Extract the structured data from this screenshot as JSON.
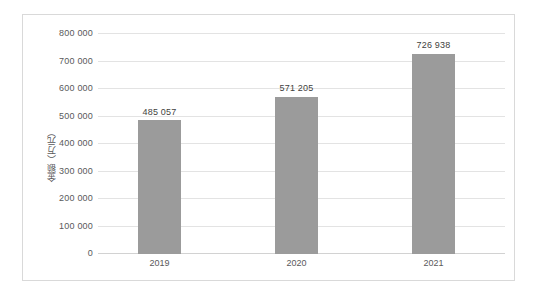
{
  "chart_data": {
    "type": "bar",
    "title": "",
    "subtitle": "",
    "xlabel": "",
    "ylabel": "金额（万元）",
    "categories": [
      "2019",
      "2020",
      "2021"
    ],
    "values": [
      485057,
      571205,
      726938
    ],
    "value_labels": [
      "485 057",
      "571 205",
      "726 938"
    ],
    "ylim": [
      0,
      800000
    ],
    "ytick_values": [
      0,
      100000,
      200000,
      300000,
      400000,
      500000,
      600000,
      700000,
      800000
    ],
    "ytick_labels": [
      "0",
      "100 000",
      "200 000",
      "300 000",
      "400 000",
      "500 000",
      "600 000",
      "700 000",
      "800 000"
    ],
    "grid": true,
    "legend": false,
    "legend_position": "none",
    "series": [
      {
        "name": "金额（万元）",
        "values": [
          485057,
          571205,
          726938
        ],
        "color": "#9b9b9b"
      }
    ],
    "colors": {
      "bar": "#9b9b9b",
      "gridline": "#e3e3e3",
      "baseline": "#d2d2d2",
      "frame_border": "#d9d9d9",
      "tick_text": "#59595b",
      "value_text": "#3f3f40",
      "plot_background": "#ffffff"
    }
  }
}
